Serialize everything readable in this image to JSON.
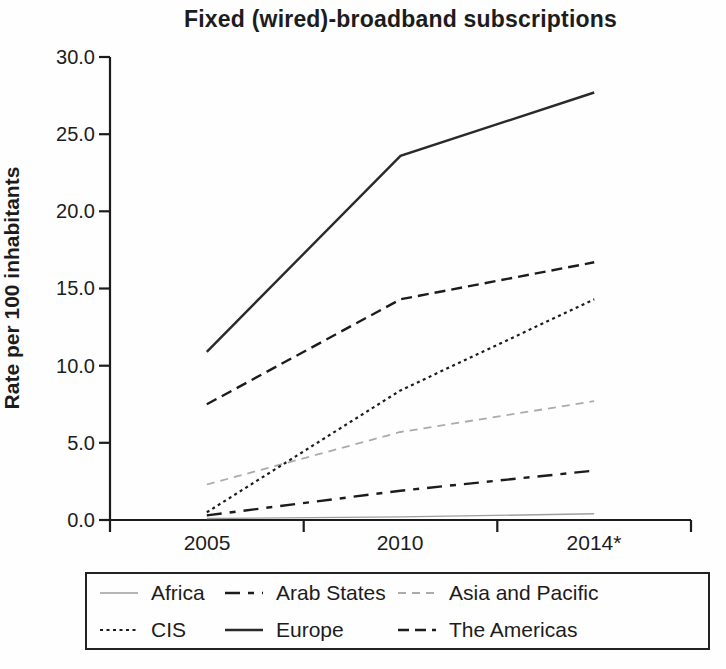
{
  "chart_data": {
    "type": "line",
    "title": "Fixed (wired)-broadband subscriptions",
    "ylabel": "Rate per 100 inhabitants",
    "xlabel": "",
    "categories": [
      "2005",
      "2010",
      "2014*"
    ],
    "ylim": [
      0,
      30
    ],
    "ytick_labels": [
      "0.0",
      "5.0",
      "10.0",
      "15.0",
      "20.0",
      "25.0",
      "30.0"
    ],
    "grid": false,
    "legend_position": "bottom",
    "axis_color": "#1c1c1c",
    "series": [
      {
        "name": "Africa",
        "values": [
          0.1,
          0.2,
          0.4
        ],
        "color": "#9e9e9e",
        "dash": "none",
        "width": 1.4
      },
      {
        "name": "Arab States",
        "values": [
          0.3,
          1.9,
          3.2
        ],
        "color": "#1c1c1c",
        "dash": "15 8 6 8",
        "width": 2.4
      },
      {
        "name": "Asia and Pacific",
        "values": [
          2.3,
          5.7,
          7.7
        ],
        "color": "#ababab",
        "dash": "8 6",
        "width": 1.8
      },
      {
        "name": "CIS",
        "values": [
          0.5,
          8.4,
          14.3
        ],
        "color": "#1c1c1c",
        "dash": "3 3.5",
        "width": 2.2
      },
      {
        "name": "Europe",
        "values": [
          10.9,
          23.6,
          27.7
        ],
        "color": "#2a2a2a",
        "dash": "none",
        "width": 2.4
      },
      {
        "name": "The Americas",
        "values": [
          7.5,
          14.3,
          16.7
        ],
        "color": "#1c1c1c",
        "dash": "11 6",
        "width": 2.4
      }
    ]
  }
}
